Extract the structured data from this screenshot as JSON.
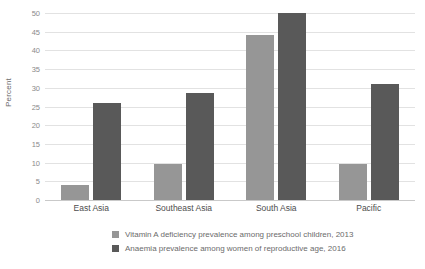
{
  "chart_data": {
    "type": "bar",
    "title": "",
    "xlabel": "",
    "ylabel": "Percent",
    "ylim": [
      0,
      50
    ],
    "yticks": [
      0,
      5,
      10,
      15,
      20,
      25,
      30,
      35,
      40,
      45,
      50
    ],
    "grid": true,
    "legend_position": "bottom-left",
    "categories": [
      "East Asia",
      "Southeast Asia",
      "South Asia",
      "Pacific"
    ],
    "series": [
      {
        "name": "Vitamin A deficiency prevalence among preschool children, 2013",
        "color": "#969696",
        "values": [
          4,
          9.5,
          44,
          9.5
        ]
      },
      {
        "name": "Anaemia prevalence among women of reproductive age, 2016",
        "color": "#595959",
        "values": [
          26,
          28.5,
          50,
          31
        ]
      }
    ]
  },
  "axis": {
    "y_title": "Percent"
  }
}
